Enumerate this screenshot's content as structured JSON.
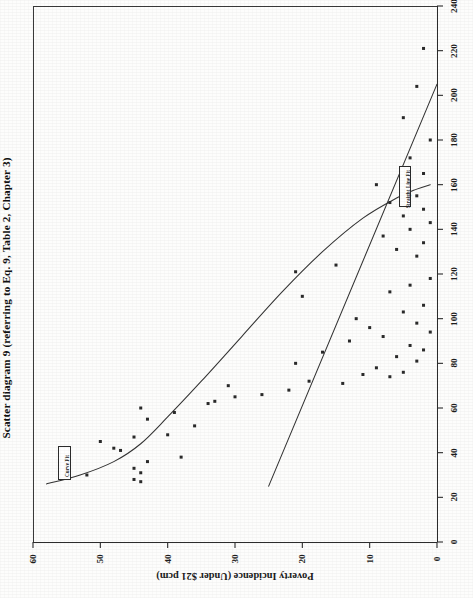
{
  "figure": {
    "title": "Scatter diagram 9 (referring to Eq. 9, Table 2, Chapter 3)",
    "orientation": "rotated-90-landscape-on-portrait-page"
  },
  "legend": {
    "curve_fit_label": "Curve Fit",
    "straight_line_fit_label": "Straight Line Fit",
    "position": "inside-plot"
  },
  "axes": {
    "x_axis_label": "",
    "y_axis_label": "Poverty Incidence (Under $21 pcm)",
    "x_ticks": [
      "0",
      "20",
      "40",
      "60",
      "80",
      "100",
      "120",
      "140",
      "160",
      "180",
      "200",
      "220",
      "240"
    ],
    "y_ticks": [
      "0",
      "10",
      "20",
      "30",
      "40",
      "50",
      "60"
    ]
  },
  "chart_data": {
    "type": "scatter",
    "title": "Scatter diagram 9 (referring to Eq. 9, Table 2, Chapter 3)",
    "xlabel": "",
    "ylabel": "Poverty Incidence (Under $21 pcm)",
    "xlim": [
      0,
      240
    ],
    "ylim": [
      0,
      60
    ],
    "grid": false,
    "legend_position": "inside-plot",
    "x_tick_values": [
      0,
      20,
      40,
      60,
      80,
      100,
      120,
      140,
      160,
      180,
      200,
      220,
      240
    ],
    "y_tick_values": [
      0,
      10,
      20,
      30,
      40,
      50,
      60
    ],
    "series": [
      {
        "name": "Observations",
        "marker": "square",
        "points": [
          [
            27,
            44
          ],
          [
            28,
            45
          ],
          [
            30,
            52
          ],
          [
            31,
            44
          ],
          [
            33,
            45
          ],
          [
            36,
            43
          ],
          [
            38,
            38
          ],
          [
            41,
            47
          ],
          [
            42,
            48
          ],
          [
            45,
            50
          ],
          [
            47,
            45
          ],
          [
            48,
            40
          ],
          [
            52,
            36
          ],
          [
            55,
            43
          ],
          [
            58,
            39
          ],
          [
            60,
            44
          ],
          [
            62,
            34
          ],
          [
            63,
            33
          ],
          [
            65,
            30
          ],
          [
            66,
            26
          ],
          [
            68,
            22
          ],
          [
            70,
            31
          ],
          [
            71,
            14
          ],
          [
            72,
            19
          ],
          [
            74,
            7
          ],
          [
            75,
            11
          ],
          [
            76,
            5
          ],
          [
            78,
            9
          ],
          [
            80,
            21
          ],
          [
            81,
            3
          ],
          [
            83,
            6
          ],
          [
            85,
            17
          ],
          [
            86,
            2
          ],
          [
            88,
            4
          ],
          [
            90,
            13
          ],
          [
            92,
            8
          ],
          [
            94,
            1
          ],
          [
            96,
            10
          ],
          [
            98,
            3
          ],
          [
            100,
            12
          ],
          [
            103,
            5
          ],
          [
            106,
            2
          ],
          [
            110,
            20
          ],
          [
            112,
            7
          ],
          [
            115,
            4
          ],
          [
            118,
            1
          ],
          [
            121,
            21
          ],
          [
            124,
            15
          ],
          [
            128,
            3
          ],
          [
            131,
            6
          ],
          [
            134,
            2
          ],
          [
            137,
            8
          ],
          [
            140,
            4
          ],
          [
            143,
            1
          ],
          [
            146,
            5
          ],
          [
            149,
            2
          ],
          [
            152,
            7
          ],
          [
            155,
            3
          ],
          [
            160,
            9
          ],
          [
            165,
            2
          ],
          [
            172,
            4
          ],
          [
            180,
            1
          ],
          [
            190,
            5
          ],
          [
            204,
            3
          ],
          [
            221,
            2
          ]
        ]
      }
    ],
    "fits": [
      {
        "name": "Curve Fit",
        "style": "solid",
        "description": "convex decaying curve from upper-left to lower-right, flattening at high poverty incidence",
        "path_points": [
          [
            26,
            58
          ],
          [
            30,
            53
          ],
          [
            36,
            48
          ],
          [
            44,
            44
          ],
          [
            56,
            40
          ],
          [
            72,
            35
          ],
          [
            92,
            29
          ],
          [
            112,
            23
          ],
          [
            130,
            17
          ],
          [
            145,
            11
          ],
          [
            154,
            6
          ],
          [
            158,
            3
          ],
          [
            160,
            1
          ]
        ]
      },
      {
        "name": "Straight Line Fit",
        "style": "solid",
        "description": "negatively sloped straight regression line",
        "path_points": [
          [
            25,
            25
          ],
          [
            205,
            0
          ]
        ],
        "endpoints": {
          "x1": 25,
          "y1": 25,
          "x2": 205,
          "y2": 0
        }
      }
    ]
  }
}
